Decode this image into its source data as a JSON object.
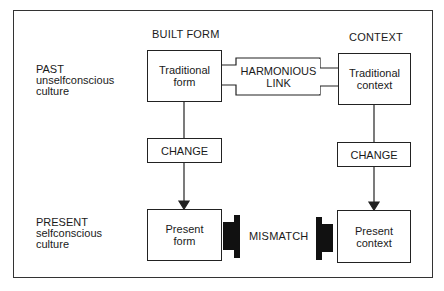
{
  "diagram": {
    "column_headers": {
      "built_form": "BUILT FORM",
      "context": "CONTEXT"
    },
    "row_labels": {
      "past": "PAST\nunselfconscious\nculture",
      "present": "PRESENT\nselfconscious\nculture"
    },
    "boxes": {
      "traditional_form": "Traditional\nform",
      "harmonious_link": "HARMONIOUS\nLINK",
      "traditional_context": "Traditional\ncontext",
      "change_left": "CHANGE",
      "change_right": "CHANGE",
      "present_form": "Present\nform",
      "present_context": "Present\ncontext",
      "mismatch": "MISMATCH"
    },
    "edges": [
      {
        "from": "traditional_form",
        "to": "harmonious_link",
        "type": "notched-connector"
      },
      {
        "from": "harmonious_link",
        "to": "traditional_context",
        "type": "notched-connector"
      },
      {
        "from": "traditional_form",
        "to": "change_left",
        "type": "line"
      },
      {
        "from": "change_left",
        "to": "present_form",
        "type": "arrow"
      },
      {
        "from": "traditional_context",
        "to": "change_right",
        "type": "line"
      },
      {
        "from": "change_right",
        "to": "present_context",
        "type": "arrow"
      },
      {
        "from": "present_form",
        "to": "present_context",
        "type": "mismatch-blocks",
        "label": "MISMATCH"
      }
    ],
    "colors": {
      "stroke": "#222222",
      "fill": "#ffffff",
      "block": "#111111"
    }
  }
}
